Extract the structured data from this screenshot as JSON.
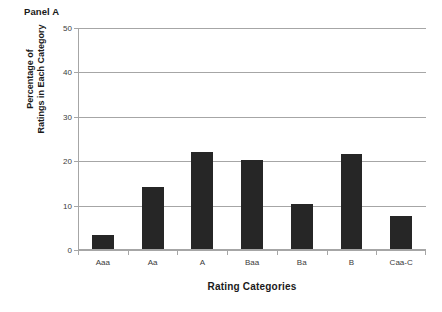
{
  "figure": {
    "panel_title": "Panel A",
    "background_color": "#ffffff",
    "bar_color": "#262626",
    "grid_color": "#a6a6a6"
  },
  "chart_data": {
    "type": "bar",
    "title": "Panel A",
    "subtitle": "",
    "xlabel": "Rating Categories",
    "ylabel": "Percentage of Ratings in Each Category",
    "ylabel_line1": "Percentage of",
    "ylabel_line2": "Ratings in Each Category",
    "categories": [
      "Aaa",
      "Aa",
      "A",
      "Baa",
      "Ba",
      "B",
      "Caa-C"
    ],
    "values": [
      3.4,
      14.2,
      22.1,
      20.3,
      10.4,
      21.6,
      7.7
    ],
    "ylim": [
      0,
      50
    ],
    "yticks": [
      0,
      10,
      20,
      30,
      40,
      50
    ],
    "ytick_labels": [
      "0",
      "10",
      "20",
      "30",
      "40",
      "50"
    ],
    "grid": true,
    "grid_axis": "y",
    "legend": false,
    "legend_position": "none",
    "bar_color": "#262626"
  }
}
